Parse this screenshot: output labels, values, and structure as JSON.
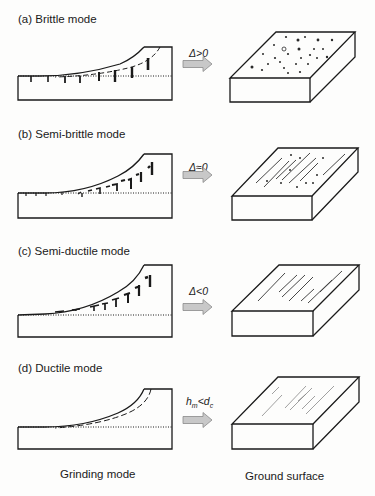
{
  "figure": {
    "panels": [
      {
        "id": "a",
        "label": "(a) Brittle mode",
        "condition": "Δ>0",
        "surface": "dots",
        "top": 12,
        "cracks": "brittle"
      },
      {
        "id": "b",
        "label": "(b) Semi-brittle mode",
        "condition": "Δ≈0",
        "surface": "scratches-dots",
        "top": 127,
        "cracks": "semi-brittle"
      },
      {
        "id": "c",
        "label": "(c) Semi-ductile mode",
        "condition": "Δ<0",
        "surface": "scratches",
        "top": 243,
        "cracks": "semi-ductile"
      },
      {
        "id": "d",
        "label": "(d) Ductile mode",
        "condition_html": "h<sub>m</sub>&lt;d<sub>c</sub>",
        "condition": "hm<dc",
        "surface": "fine-scratches",
        "top": 360,
        "cracks": "none"
      }
    ],
    "footer": {
      "left": "Grinding mode",
      "right": "Ground surface"
    },
    "colors": {
      "line": "#1a1a1a",
      "arrow_fill": "#c8c8c8",
      "arrow_stroke": "#8a8a8a",
      "background": "#fdfdfc"
    }
  }
}
